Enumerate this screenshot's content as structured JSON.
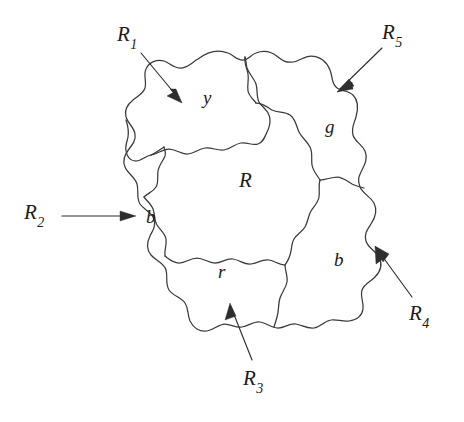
{
  "figure": {
    "background_color": "#ffffff",
    "ink_color": "#3a3a3a"
  },
  "regions": [
    {
      "id": "R",
      "label": "R",
      "color_letter": "R",
      "role": "central-region"
    },
    {
      "id": "y",
      "label": "y",
      "color_letter": "y",
      "color_name": "yellow",
      "callout": "R1"
    },
    {
      "id": "g",
      "label": "g",
      "color_letter": "g",
      "color_name": "green",
      "callout": "R5"
    },
    {
      "id": "b1",
      "label": "b",
      "color_letter": "b",
      "color_name": "blue",
      "callout": "R2"
    },
    {
      "id": "r",
      "label": "r",
      "color_letter": "r",
      "color_name": "red",
      "callout": "R3"
    },
    {
      "id": "b2",
      "label": "b",
      "color_letter": "b",
      "color_name": "blue",
      "callout": "R4"
    }
  ],
  "callouts": [
    {
      "id": "R1",
      "base": "R",
      "subscript": "1",
      "points_to": "y",
      "arrow_direction": "down-right"
    },
    {
      "id": "R2",
      "base": "R",
      "subscript": "2",
      "points_to": "b1",
      "arrow_direction": "right"
    },
    {
      "id": "R3",
      "base": "R",
      "subscript": "3",
      "points_to": "r",
      "arrow_direction": "up-left"
    },
    {
      "id": "R4",
      "base": "R",
      "subscript": "4",
      "points_to": "b2",
      "arrow_direction": "up-left"
    },
    {
      "id": "R5",
      "base": "R",
      "subscript": "5",
      "points_to": "g",
      "arrow_direction": "down-left"
    }
  ],
  "labels": {
    "center_R": "R",
    "region_y": "y",
    "region_g": "g",
    "region_b_left": "b",
    "region_r": "r",
    "region_b_right": "b",
    "callout_R1_base": "R",
    "callout_R1_sub": "1",
    "callout_R2_base": "R",
    "callout_R2_sub": "2",
    "callout_R3_base": "R",
    "callout_R3_sub": "3",
    "callout_R4_base": "R",
    "callout_R4_sub": "4",
    "callout_R5_base": "R",
    "callout_R5_sub": "5"
  }
}
